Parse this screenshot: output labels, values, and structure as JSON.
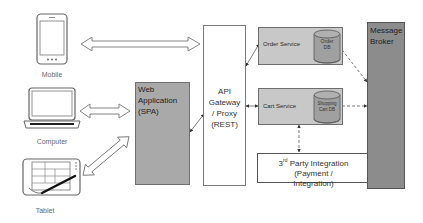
{
  "diagram": {
    "clients": [
      {
        "id": "mobile",
        "label": "Mobile",
        "icon": "smartphone-icon"
      },
      {
        "id": "computer",
        "label": "Computer",
        "icon": "laptop-icon"
      },
      {
        "id": "tablet",
        "label": "Tablet",
        "icon": "tablet-icon"
      }
    ],
    "web_app": {
      "line1": "Web",
      "line2": "Application",
      "line3": "(SPA)"
    },
    "gateway": {
      "line1": "API",
      "line2": "Gateway",
      "line3": "/ Proxy",
      "line4": "(REST)"
    },
    "order_service": {
      "label": "Order Service",
      "db_line1": "Order",
      "db_line2": "DB"
    },
    "cart_service": {
      "label": "Cart Service",
      "db_line1": "Shopping",
      "db_line2": "Cart DB"
    },
    "third_party": {
      "prefix": "3",
      "sup": "rd",
      "line1_rest": " Party Integration",
      "line2": "(Payment /",
      "line3": "Integration)"
    },
    "message_broker": {
      "line1": "Message",
      "line2": "Broker"
    },
    "colors": {
      "web_app_fill": "#a9a9a9",
      "service_fill": "#c8c8c8",
      "broker_fill": "#8c8c8c",
      "db_fill": "#a0a0a0",
      "line": "#555555"
    },
    "connections": [
      {
        "from": "mobile",
        "to": "gateway",
        "style": "hollow-double-arrow"
      },
      {
        "from": "computer",
        "to": "web_app",
        "style": "hollow-double-arrow"
      },
      {
        "from": "tablet",
        "to": "web_app",
        "style": "hollow-double-arrow"
      },
      {
        "from": "web_app",
        "to": "gateway",
        "style": "double-arrow"
      },
      {
        "from": "gateway",
        "to": "order_service",
        "style": "double-arrow"
      },
      {
        "from": "gateway",
        "to": "cart_service",
        "style": "double-arrow"
      },
      {
        "from": "cart_service",
        "to": "third_party",
        "style": "dashed-double-arrow"
      },
      {
        "from": "order_service",
        "to": "message_broker",
        "style": "dashed-double-arrow"
      },
      {
        "from": "cart_service",
        "to": "message_broker",
        "style": "dashed-double-arrow"
      }
    ]
  }
}
